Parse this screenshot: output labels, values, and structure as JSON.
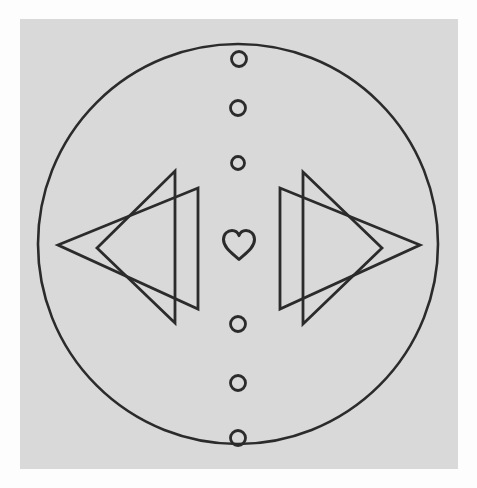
{
  "artwork": {
    "title": "Geometric Emblem",
    "description": "Circular emblem with mirrored double triangles, a central heart and a vertical column of small circles",
    "canvas": {
      "width": 477,
      "height": 488
    },
    "colors": {
      "page_background": "#fdfdfd",
      "panel_background": "#d9d9d9",
      "stroke": "#2b2b2b",
      "fill": "none"
    },
    "panel": {
      "x": 20,
      "y": 19,
      "width": 438,
      "height": 450
    },
    "stroke_widths": {
      "outer_circle": 2.6,
      "triangle": 2.8,
      "dot": 2.8,
      "heart": 3.0
    },
    "outer_circle": {
      "cx": 238,
      "cy": 244,
      "r": 200,
      "label": "outer-ring"
    },
    "dots": [
      {
        "id": "dot-1",
        "cx": 239,
        "cy": 59,
        "r": 7.5
      },
      {
        "id": "dot-2",
        "cx": 238,
        "cy": 108,
        "r": 7.5
      },
      {
        "id": "dot-3",
        "cx": 238,
        "cy": 163,
        "r": 6.5
      },
      {
        "id": "dot-4",
        "cx": 238,
        "cy": 324,
        "r": 7.5
      },
      {
        "id": "dot-5",
        "cx": 238,
        "cy": 383,
        "r": 7.5
      },
      {
        "id": "dot-6",
        "cx": 238,
        "cy": 438,
        "r": 7.5
      }
    ],
    "heart": {
      "id": "center-heart",
      "cx": 239,
      "cy": 245,
      "width": 36,
      "height": 30,
      "path": "M239 259.5 C232 253 223.5 247.5 223.5 239.5 C223.5 233.5 228 230.5 232 230.5 C235.8 230.5 238.2 233.4 239 235.6 C239.8 233.4 242.2 230.5 246 230.5 C250 230.5 254.5 233.5 254.5 239.5 C254.5 247.5 246 253 239 259.5 Z"
    },
    "triangles": [
      {
        "id": "left-back-triangle",
        "direction": "left",
        "points": "97,248 175,171 175,323",
        "layer": "back"
      },
      {
        "id": "left-front-triangle",
        "direction": "left",
        "points": "58,245 198,188 198,309",
        "layer": "front"
      },
      {
        "id": "right-back-triangle",
        "direction": "right",
        "points": "382,248 303,172 303,324",
        "layer": "back"
      },
      {
        "id": "right-front-triangle",
        "direction": "right",
        "points": "420,245 280,188 280,309",
        "layer": "front"
      }
    ]
  }
}
